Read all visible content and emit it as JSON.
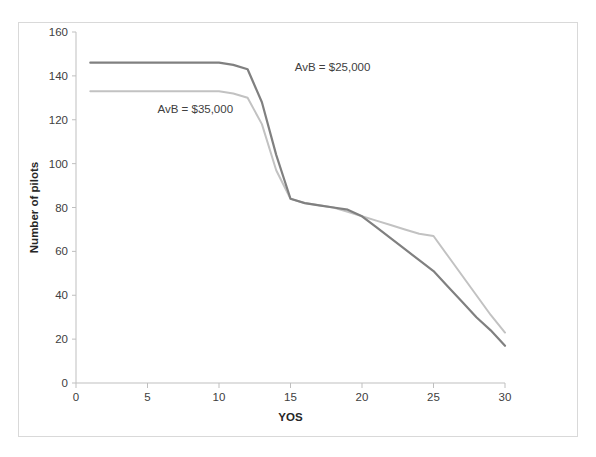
{
  "figure": {
    "background_color": "#ffffff",
    "frame_border_color": "#d9d9d9"
  },
  "chart_data": {
    "type": "line",
    "title": "",
    "subtitle": "",
    "xlabel": "YOS",
    "ylabel": "Number of pilots",
    "xlim": [
      0,
      30
    ],
    "ylim": [
      0,
      160
    ],
    "xticks": [
      0,
      5,
      10,
      15,
      20,
      25,
      30
    ],
    "yticks": [
      0,
      20,
      40,
      60,
      80,
      100,
      120,
      140,
      160
    ],
    "xtick_labels": [
      "0",
      "5",
      "10",
      "15",
      "20",
      "25",
      "30"
    ],
    "ytick_labels": [
      "0",
      "20",
      "40",
      "60",
      "80",
      "100",
      "120",
      "140",
      "160"
    ],
    "grid": false,
    "legend_position": "inline-annotations",
    "x": [
      1,
      2,
      3,
      4,
      5,
      6,
      7,
      8,
      9,
      10,
      11,
      12,
      13,
      14,
      15,
      16,
      17,
      18,
      19,
      20,
      21,
      22,
      23,
      24,
      25,
      26,
      27,
      28,
      29,
      30
    ],
    "series": [
      {
        "name": "AvB = $25,000",
        "color": "#808080",
        "line_width": 2.2,
        "values": [
          146,
          146,
          146,
          146,
          146,
          146,
          146,
          146,
          146,
          146,
          145,
          143,
          128,
          104,
          84,
          82,
          81,
          80,
          79,
          76,
          71,
          66,
          61,
          56,
          51,
          44,
          37,
          30,
          24,
          17
        ]
      },
      {
        "name": "AvB = $35,000",
        "color": "#c2c2c2",
        "line_width": 2.0,
        "values": [
          133,
          133,
          133,
          133,
          133,
          133,
          133,
          133,
          133,
          133,
          132,
          130,
          118,
          97,
          84,
          82,
          81,
          80,
          78,
          76,
          74,
          72,
          70,
          68,
          67,
          58,
          49,
          40,
          31,
          23
        ]
      }
    ],
    "annotations": [
      {
        "text": "AvB = $25,000",
        "x_data": 15.3,
        "y_data": 142,
        "color": "#404040"
      },
      {
        "text": "AvB = $35,000",
        "x_data": 5.7,
        "y_data": 123,
        "color": "#404040"
      }
    ]
  }
}
